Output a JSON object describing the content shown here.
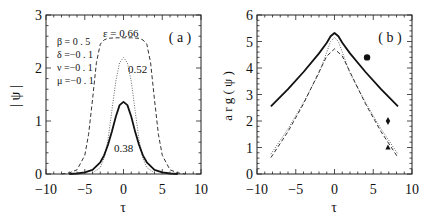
{
  "chart_data": [
    {
      "panel": "a",
      "type": "line",
      "panel_label": "( a )",
      "xlabel": "τ",
      "ylabel": "| ψ |",
      "xlim": [
        -10,
        10
      ],
      "ylim": [
        0,
        3
      ],
      "xticks": [
        "−10",
        "−5",
        "0",
        "5",
        "10"
      ],
      "yticks": [
        "0",
        "1",
        "2",
        "3"
      ],
      "parameters": [
        "β = 0 . 5",
        "δ =−0 . 1",
        "ν =−0 . 1",
        "μ =−0 . 1"
      ],
      "series": [
        {
          "name": "ε = 0.66",
          "label": "ε = 0.66",
          "style": "dashed",
          "peak": 2.57,
          "x": [
            -8,
            -7,
            -6,
            -5,
            -4.5,
            -4,
            -3.5,
            -3,
            -2.5,
            -2,
            -1,
            0,
            1,
            2,
            2.5,
            3,
            3.5,
            4,
            4.5,
            5,
            6,
            7,
            8
          ],
          "y": [
            0.0,
            0.02,
            0.08,
            0.35,
            0.75,
            1.4,
            2.1,
            2.45,
            2.53,
            2.56,
            2.57,
            2.57,
            2.57,
            2.56,
            2.53,
            2.45,
            2.1,
            1.4,
            0.75,
            0.35,
            0.08,
            0.02,
            0.0
          ]
        },
        {
          "name": "ε = 0.52",
          "label": "0.52",
          "style": "dotted",
          "peak": 2.2,
          "x": [
            -4,
            -3,
            -2.5,
            -2,
            -1.5,
            -1,
            -0.5,
            0,
            0.5,
            1,
            1.5,
            2,
            2.5,
            3,
            4
          ],
          "y": [
            0.02,
            0.12,
            0.3,
            0.65,
            1.2,
            1.75,
            2.1,
            2.2,
            2.1,
            1.75,
            1.2,
            0.65,
            0.3,
            0.12,
            0.02
          ]
        },
        {
          "name": "ε = 0.38",
          "label": "0.38",
          "style": "solid",
          "peak": 1.36,
          "x": [
            -7,
            -6,
            -5,
            -4,
            -3,
            -2.5,
            -2,
            -1.5,
            -1,
            -0.5,
            0,
            0.5,
            1,
            1.5,
            2,
            2.5,
            3,
            4,
            5,
            6,
            7
          ],
          "y": [
            0.0,
            0.01,
            0.03,
            0.08,
            0.22,
            0.35,
            0.55,
            0.8,
            1.08,
            1.3,
            1.36,
            1.3,
            1.08,
            0.8,
            0.55,
            0.35,
            0.22,
            0.08,
            0.03,
            0.01,
            0.0
          ]
        }
      ]
    },
    {
      "panel": "b",
      "type": "line",
      "panel_label": "( b )",
      "xlabel": "τ",
      "ylabel": "a r g ( ψ )",
      "xlim": [
        -10,
        10
      ],
      "ylim": [
        0,
        6
      ],
      "xticks": [
        "−10",
        "−5",
        "0",
        "5",
        "10"
      ],
      "yticks": [
        "0",
        "1",
        "2",
        "3",
        "4",
        "5",
        "6"
      ],
      "series": [
        {
          "name": "ε = 0.38",
          "style": "solid",
          "marker": "circle",
          "marker_at": [
            4.2,
            4.4
          ],
          "x": [
            -8.2,
            -6,
            -4,
            -2,
            -1,
            -0.5,
            0,
            0.5,
            1,
            2,
            4,
            6,
            8.2
          ],
          "y": [
            2.55,
            3.2,
            3.85,
            4.55,
            4.95,
            5.2,
            5.32,
            5.2,
            4.95,
            4.55,
            3.85,
            3.2,
            2.55
          ]
        },
        {
          "name": "ε = 0.52",
          "style": "dotted",
          "marker": "diamond",
          "marker_at": [
            6.9,
            2.0
          ],
          "x": [
            -8.2,
            -6,
            -4,
            -2,
            -1,
            -0.5,
            0,
            0.5,
            1,
            2,
            4,
            6,
            8.2
          ],
          "y": [
            0.75,
            1.7,
            2.7,
            3.8,
            4.6,
            5.0,
            5.15,
            5.0,
            4.6,
            3.8,
            2.7,
            1.7,
            0.75
          ]
        },
        {
          "name": "ε = 0.66",
          "style": "dashed",
          "marker": "triangle",
          "marker_at": [
            6.9,
            1.0
          ],
          "x": [
            -8.2,
            -6,
            -4,
            -2,
            -1,
            0,
            1,
            2,
            4,
            6,
            8.2
          ],
          "y": [
            0.62,
            1.6,
            2.65,
            3.85,
            4.45,
            4.72,
            4.45,
            3.85,
            2.65,
            1.6,
            0.62
          ]
        }
      ]
    }
  ]
}
